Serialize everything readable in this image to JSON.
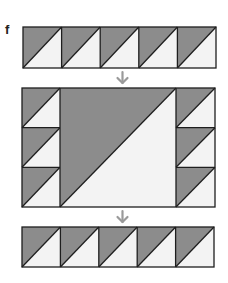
{
  "figure": {
    "label": "f",
    "colors": {
      "dark": "#8c8c8c",
      "light": "#f3f3f3",
      "stroke": "#1e1e1e",
      "arrow": "#9a9a9a"
    },
    "top_row": {
      "units": 5,
      "description": "row of five half-square triangle units, dark upper-left, light lower-right"
    },
    "middle_block": {
      "left_column_units": 3,
      "center": "large half-square triangle, dark upper-left, light lower-right",
      "right_column_units": 3
    },
    "bottom_row": {
      "units": 5,
      "description": "row of five half-square triangle units, dark upper-left, light lower-right"
    },
    "arrows": [
      "down-arrow",
      "down-arrow"
    ]
  }
}
